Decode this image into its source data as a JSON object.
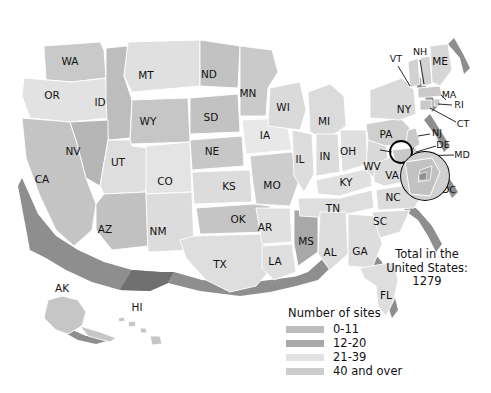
{
  "map": {
    "title": "Number of sites by state, United States",
    "background_color": "#ffffff",
    "border_color": "#ffffff",
    "shadow_color": "#8e8e8e",
    "states": [
      {
        "code": "WA",
        "label": "WA",
        "bin": "12-20",
        "fill": "#c9c9c9",
        "lx": 70,
        "ly": 62
      },
      {
        "code": "OR",
        "label": "OR",
        "bin": "21-39",
        "fill": "#e2e2e2",
        "lx": 52,
        "ly": 96
      },
      {
        "code": "CA",
        "label": "CA",
        "bin": "40 and over",
        "fill": "#c4c4c4",
        "lx": 42,
        "ly": 180
      },
      {
        "code": "ID",
        "label": "ID",
        "bin": "12-20",
        "fill": "#bdbdbd",
        "lx": 100,
        "ly": 103
      },
      {
        "code": "NV",
        "label": "NV",
        "bin": "12-20",
        "fill": "#b6b6b6",
        "lx": 73,
        "ly": 152
      },
      {
        "code": "MT",
        "label": "MT",
        "bin": "21-39",
        "fill": "#e0e0e0",
        "lx": 146,
        "ly": 76
      },
      {
        "code": "WY",
        "label": "WY",
        "bin": "12-20",
        "fill": "#c6c6c6",
        "lx": 148,
        "ly": 122
      },
      {
        "code": "UT",
        "label": "UT",
        "bin": "21-39",
        "fill": "#dedede",
        "lx": 118,
        "ly": 163
      },
      {
        "code": "CO",
        "label": "CO",
        "bin": "21-39",
        "fill": "#e4e4e4",
        "lx": 165,
        "ly": 182
      },
      {
        "code": "AZ",
        "label": "AZ",
        "bin": "12-20",
        "fill": "#c1c1c1",
        "lx": 105,
        "ly": 230
      },
      {
        "code": "NM",
        "label": "NM",
        "bin": "21-39",
        "fill": "#dcdcdc",
        "lx": 158,
        "ly": 232
      },
      {
        "code": "ND",
        "label": "ND",
        "bin": "12-20",
        "fill": "#c2c2c2",
        "lx": 209,
        "ly": 75
      },
      {
        "code": "SD",
        "label": "SD",
        "bin": "12-20",
        "fill": "#c2c2c2",
        "lx": 211,
        "ly": 118
      },
      {
        "code": "NE",
        "label": "NE",
        "bin": "12-20",
        "fill": "#c7c7c7",
        "lx": 212,
        "ly": 152
      },
      {
        "code": "KS",
        "label": "KS",
        "bin": "21-39",
        "fill": "#dcdcdc",
        "lx": 229,
        "ly": 187
      },
      {
        "code": "OK",
        "label": "OK",
        "bin": "12-20",
        "fill": "#c5c5c5",
        "lx": 238,
        "ly": 220
      },
      {
        "code": "TX",
        "label": "TX",
        "bin": "21-39",
        "fill": "#dedede",
        "lx": 220,
        "ly": 265
      },
      {
        "code": "MN",
        "label": "MN",
        "bin": "12-20",
        "fill": "#cacaca",
        "lx": 248,
        "ly": 94
      },
      {
        "code": "IA",
        "label": "IA",
        "bin": "21-39",
        "fill": "#e8e8e8",
        "lx": 265,
        "ly": 136
      },
      {
        "code": "MO",
        "label": "MO",
        "bin": "12-20",
        "fill": "#cdcdcd",
        "lx": 272,
        "ly": 186
      },
      {
        "code": "AR",
        "label": "AR",
        "bin": "21-39",
        "fill": "#e0e0e0",
        "lx": 265,
        "ly": 228
      },
      {
        "code": "LA",
        "label": "LA",
        "bin": "21-39",
        "fill": "#dfdfdf",
        "lx": 275,
        "ly": 262
      },
      {
        "code": "WI",
        "label": "WI",
        "bin": "21-39",
        "fill": "#dadada",
        "lx": 283,
        "ly": 108
      },
      {
        "code": "IL",
        "label": "IL",
        "bin": "21-39",
        "fill": "#dddddd",
        "lx": 300,
        "ly": 160
      },
      {
        "code": "MS",
        "label": "MS",
        "bin": "0-11",
        "fill": "#a8a8a8",
        "lx": 306,
        "ly": 242
      },
      {
        "code": "MI",
        "label": "MI",
        "bin": "21-39",
        "fill": "#dbdbdb",
        "lx": 324,
        "ly": 122
      },
      {
        "code": "IN",
        "label": "IN",
        "bin": "21-39",
        "fill": "#dcdcdc",
        "lx": 325,
        "ly": 157
      },
      {
        "code": "AL",
        "label": "AL",
        "bin": "21-39",
        "fill": "#dddddd",
        "lx": 330,
        "ly": 253
      },
      {
        "code": "OH",
        "label": "OH",
        "bin": "21-39",
        "fill": "#dfdfdf",
        "lx": 348,
        "ly": 152
      },
      {
        "code": "KY",
        "label": "KY",
        "bin": "21-39",
        "fill": "#e0e0e0",
        "lx": 346,
        "ly": 183
      },
      {
        "code": "TN",
        "label": "TN",
        "bin": "21-39",
        "fill": "#dedede",
        "lx": 333,
        "ly": 209
      },
      {
        "code": "GA",
        "label": "GA",
        "bin": "21-39",
        "fill": "#dddddd",
        "lx": 360,
        "ly": 252
      },
      {
        "code": "WV",
        "label": "WV",
        "bin": "21-39",
        "fill": "#d9d9d9",
        "lx": 372,
        "ly": 167
      },
      {
        "code": "VA",
        "label": "VA",
        "bin": "21-39",
        "fill": "#dcdcdc",
        "lx": 392,
        "ly": 176
      },
      {
        "code": "NC",
        "label": "NC",
        "bin": "21-39",
        "fill": "#dcdcdc",
        "lx": 393,
        "ly": 198
      },
      {
        "code": "SC",
        "label": "SC",
        "bin": "21-39",
        "fill": "#dcdcdc",
        "lx": 380,
        "ly": 222
      },
      {
        "code": "FL",
        "label": "FL",
        "bin": "21-39",
        "fill": "#dedede",
        "lx": 386,
        "ly": 296
      },
      {
        "code": "PA",
        "label": "PA",
        "bin": "12-20",
        "fill": "#cfcfcf",
        "lx": 386,
        "ly": 135
      },
      {
        "code": "NY",
        "label": "NY",
        "bin": "21-39",
        "fill": "#dadada",
        "lx": 404,
        "ly": 110
      },
      {
        "code": "VT",
        "label": "VT",
        "bin": "40 and over",
        "fill": "#d2d2d2",
        "lx": 396,
        "ly": 59
      },
      {
        "code": "NH",
        "label": "NH",
        "bin": "40 and over",
        "fill": "#d2d2d2",
        "lx": 420,
        "ly": 52
      },
      {
        "code": "ME",
        "label": "ME",
        "bin": "21-39",
        "fill": "#d7d7d7",
        "lx": 440,
        "ly": 62
      },
      {
        "code": "MA",
        "label": "MA",
        "bin": "40 and over",
        "fill": "#c9c9c9",
        "lx": 449,
        "ly": 95
      },
      {
        "code": "RI",
        "label": "RI",
        "bin": "40 and over",
        "fill": "#c9c9c9",
        "lx": 459,
        "ly": 105
      },
      {
        "code": "CT",
        "label": "CT",
        "bin": "40 and over",
        "fill": "#c9c9c9",
        "lx": 463,
        "ly": 124
      },
      {
        "code": "NJ",
        "label": "NJ",
        "bin": "40 and over",
        "fill": "#c9c9c9",
        "lx": 437,
        "ly": 133
      },
      {
        "code": "DE",
        "label": "DE",
        "bin": "40 and over",
        "fill": "#c9c9c9",
        "lx": 443,
        "ly": 145
      },
      {
        "code": "MD",
        "label": "MD",
        "bin": "40 and over",
        "fill": "#c9c9c9",
        "lx": 462,
        "ly": 155
      },
      {
        "code": "DC",
        "label": "DC",
        "bin": "40 and over",
        "fill": "#c9c9c9",
        "lx": 449,
        "ly": 190
      },
      {
        "code": "AK",
        "label": "AK",
        "bin": "0-11",
        "fill": "#c6c6c6",
        "lx": 62,
        "ly": 289
      },
      {
        "code": "HI",
        "label": "HI",
        "bin": "0-11",
        "fill": "#c6c6c6",
        "lx": 137,
        "ly": 308
      }
    ]
  },
  "legend": {
    "title": "Number of sites",
    "items": [
      {
        "label": "0-11",
        "color": "#bdbdbd"
      },
      {
        "label": "12-20",
        "color": "#a8a8a8"
      },
      {
        "label": "21-39",
        "color": "#e2e2e2"
      },
      {
        "label": "40 and over",
        "color": "#cdcdcd"
      }
    ]
  },
  "total": {
    "line1": "Total in the",
    "line2": "United States:",
    "line3": "1279"
  },
  "callouts": {
    "magnifier_small": "magnifier-circle-chesapeake",
    "magnifier_large": "magnifier-circle-dc"
  }
}
